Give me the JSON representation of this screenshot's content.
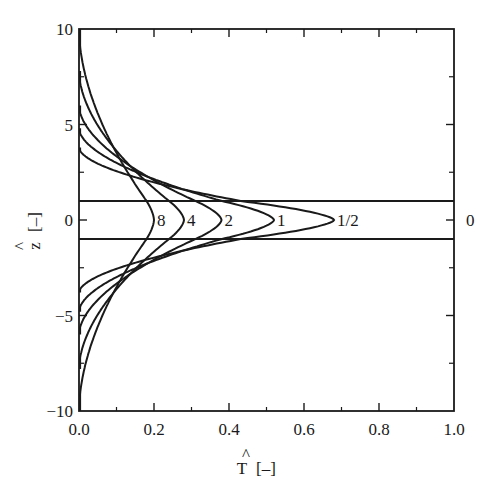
{
  "chart_data": {
    "type": "line",
    "title": "",
    "xlabel": "T̂ [–]",
    "ylabel": "ẑ [–]",
    "xlim": [
      0.0,
      1.0
    ],
    "ylim": [
      -10,
      10
    ],
    "grid": false,
    "legend": "none (curves labeled inline)",
    "x_ticks": [
      "0.0",
      "0.2",
      "0.4",
      "0.6",
      "0.8",
      "1.0"
    ],
    "x_minor_ticks": [
      0.1,
      0.3,
      0.5,
      0.7,
      0.9
    ],
    "y_ticks": [
      "-10",
      "-5",
      "0",
      "5",
      "10"
    ],
    "y_minor_ticks": [
      -7.5,
      -2.5,
      2.5,
      7.5
    ],
    "right_axis_label": "0",
    "horizontal_lines": [
      1,
      -1
    ],
    "series": [
      {
        "name": "0",
        "label": "0",
        "peak_T": 1.0,
        "z_end": 1,
        "note": "step profile: T=1 for |z|<1, 0 outside"
      },
      {
        "name": "1/2",
        "label": "1/2",
        "peak_T": 0.68,
        "edge_T": 0.43,
        "z_end": 3.8
      },
      {
        "name": "1",
        "label": "1",
        "peak_T": 0.52,
        "edge_T": 0.38,
        "z_end": 4.8
      },
      {
        "name": "2",
        "label": "2",
        "peak_T": 0.38,
        "edge_T": 0.31,
        "z_end": 6.0
      },
      {
        "name": "4",
        "label": "4",
        "peak_T": 0.28,
        "edge_T": 0.24,
        "z_end": 7.8
      },
      {
        "name": "8",
        "label": "8",
        "peak_T": 0.2,
        "edge_T": 0.18,
        "z_end": 10.0
      }
    ]
  },
  "labels": {
    "x_axis_title_hat": "^",
    "x_axis_title_main": "T",
    "x_axis_title_unit": "[–]",
    "y_axis_title_hat": "^",
    "y_axis_title_main": "z",
    "y_axis_title_unit": "[–]"
  }
}
